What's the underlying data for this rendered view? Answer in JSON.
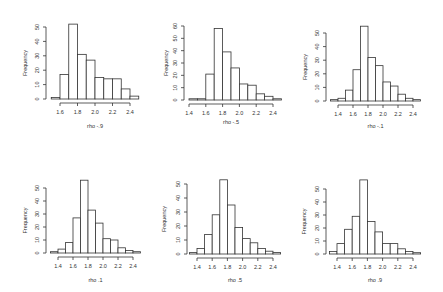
{
  "chart_data": [
    {
      "type": "bar",
      "panel": "top-left",
      "title": "",
      "xlabel": "rho -.9",
      "ylabel": "Frequency",
      "bin_start": 1.5,
      "bin_width": 0.1,
      "values": [
        1,
        17,
        52,
        31,
        27,
        15,
        14,
        14,
        7,
        2
      ],
      "xticks": [
        1.6,
        1.8,
        2.0,
        2.2,
        2.4
      ],
      "yticks": [
        0,
        10,
        20,
        30,
        40,
        50
      ],
      "ylim": [
        0,
        52
      ],
      "layout": {
        "x0": 60,
        "x1": 130,
        "xv0": 1.6,
        "xv1": 2.4,
        "ybase": 99,
        "ytop": 27,
        "ytopv": 50,
        "axisx": 46,
        "ylab_x": 27,
        "xlab_y": 128
      }
    },
    {
      "type": "bar",
      "panel": "top-middle",
      "title": "",
      "xlabel": "rho -.5",
      "ylabel": "Frequency",
      "bin_start": 1.4,
      "bin_width": 0.1,
      "values": [
        1,
        1,
        21,
        58,
        39,
        26,
        13,
        12,
        5,
        3,
        1
      ],
      "xticks": [
        1.4,
        1.6,
        1.8,
        2.0,
        2.2,
        2.4
      ],
      "yticks": [
        0,
        10,
        20,
        30,
        40,
        50,
        60
      ],
      "ylim": [
        0,
        60
      ],
      "layout": {
        "x0": 189,
        "x1": 273,
        "xv0": 1.4,
        "xv1": 2.4,
        "ybase": 100,
        "ytop": 26,
        "ytopv": 60,
        "axisx": 184,
        "ylab_x": 168,
        "xlab_y": 124
      }
    },
    {
      "type": "bar",
      "panel": "top-right",
      "title": "",
      "xlabel": "rho -.1",
      "ylabel": "Frequency",
      "bin_start": 1.3,
      "bin_width": 0.1,
      "values": [
        1,
        2,
        8,
        23,
        55,
        32,
        26,
        14,
        11,
        5,
        2,
        1
      ],
      "xticks": [
        1.4,
        1.6,
        1.8,
        2.0,
        2.2,
        2.4
      ],
      "yticks": [
        0,
        10,
        20,
        30,
        40,
        50
      ],
      "ylim": [
        0,
        55
      ],
      "layout": {
        "x0": 338,
        "x1": 413,
        "xv0": 1.4,
        "xv1": 2.4,
        "ybase": 101,
        "ytop": 33,
        "ytopv": 50,
        "axisx": 326,
        "ylab_x": 307,
        "xlab_y": 128
      }
    },
    {
      "type": "bar",
      "panel": "bottom-left",
      "title": "",
      "xlabel": "rho .1",
      "ylabel": "Frequency",
      "bin_start": 1.3,
      "bin_width": 0.1,
      "values": [
        1,
        3,
        8,
        27,
        56,
        33,
        23,
        11,
        10,
        4,
        2,
        1
      ],
      "xticks": [
        1.4,
        1.6,
        1.8,
        2.0,
        2.2,
        2.4
      ],
      "yticks": [
        0,
        10,
        20,
        30,
        40,
        50
      ],
      "ylim": [
        0,
        56
      ],
      "layout": {
        "x0": 58,
        "x1": 133,
        "xv0": 1.4,
        "xv1": 2.4,
        "ybase": 253,
        "ytop": 188,
        "ytopv": 50,
        "axisx": 46,
        "ylab_x": 27,
        "xlab_y": 282
      }
    },
    {
      "type": "bar",
      "panel": "bottom-middle",
      "title": "",
      "xlabel": "rho .5",
      "ylabel": "Frequency",
      "bin_start": 1.3,
      "bin_width": 0.1,
      "values": [
        1,
        4,
        14,
        28,
        53,
        35,
        19,
        11,
        8,
        4,
        2,
        1
      ],
      "xticks": [
        1.4,
        1.6,
        1.8,
        2.0,
        2.2,
        2.4
      ],
      "yticks": [
        0,
        10,
        20,
        30,
        40,
        50
      ],
      "ylim": [
        0,
        53
      ],
      "layout": {
        "x0": 197,
        "x1": 273,
        "xv0": 1.4,
        "xv1": 2.4,
        "ybase": 254,
        "ytop": 184,
        "ytopv": 50,
        "axisx": 187,
        "ylab_x": 166,
        "xlab_y": 282
      }
    },
    {
      "type": "bar",
      "panel": "bottom-right",
      "title": "",
      "xlabel": "rho .9",
      "ylabel": "Frequency",
      "bin_start": 1.3,
      "bin_width": 0.1,
      "values": [
        2,
        8,
        19,
        29,
        57,
        25,
        17,
        8,
        8,
        4,
        2,
        1
      ],
      "xticks": [
        1.4,
        1.6,
        1.8,
        2.0,
        2.2,
        2.4
      ],
      "yticks": [
        0,
        10,
        20,
        30,
        40,
        50
      ],
      "ylim": [
        0,
        57
      ],
      "layout": {
        "x0": 337,
        "x1": 413,
        "xv0": 1.4,
        "xv1": 2.4,
        "ybase": 254,
        "ytop": 189,
        "ytopv": 50,
        "axisx": 326,
        "ylab_x": 306,
        "xlab_y": 282
      }
    }
  ]
}
